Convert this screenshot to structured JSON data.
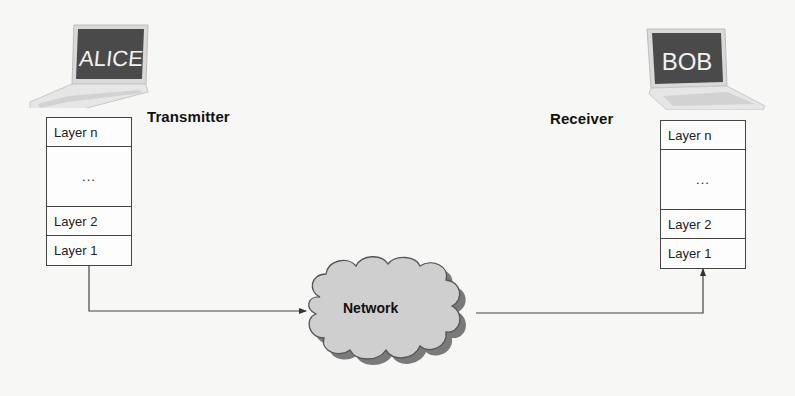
{
  "diagram": {
    "type": "layered-protocol-communication",
    "transmitter": {
      "host_name": "ALICE",
      "label": "Transmitter",
      "layers": [
        "Layer n",
        "...",
        "Layer 2",
        "Layer 1"
      ]
    },
    "receiver": {
      "host_name": "BOB",
      "label": "Receiver",
      "layers": [
        "Layer n",
        "...",
        "Layer 2",
        "Layer 1"
      ]
    },
    "network": {
      "label": "Network"
    },
    "connections": [
      {
        "from": "transmitter.Layer 1",
        "to": "network"
      },
      {
        "from": "network",
        "to": "receiver.Layer 1"
      }
    ],
    "colors": {
      "background": "#f7f7f5",
      "box_border": "#444444",
      "cloud_fill": "#cfcfcf",
      "cloud_shadow": "#7a7a7a",
      "laptop_screen": "#4a4a4a",
      "laptop_body": "#e2e2e2"
    }
  }
}
